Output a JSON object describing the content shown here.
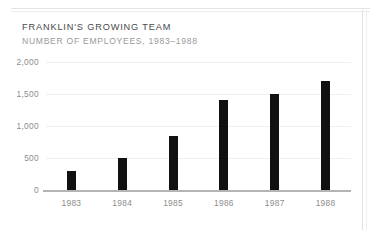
{
  "header": {
    "title": "FRANKLIN'S GROWING TEAM",
    "subtitle": "NUMBER OF EMPLOYEES, 1983–1988"
  },
  "colors": {
    "bar": "#111111",
    "gridline": "#f0f0f0",
    "axis": "#b4b4b4",
    "title_text": "#4a4a4a",
    "subtitle_text": "#9a9a9a",
    "tick_text": "#8d8d8d",
    "page_rule": "#e3e3e3"
  },
  "chart_data": {
    "type": "bar",
    "title": "FRANKLIN'S GROWING TEAM",
    "subtitle": "NUMBER OF EMPLOYEES, 1983–1988",
    "xlabel": "",
    "ylabel": "",
    "categories": [
      "1983",
      "1984",
      "1985",
      "1986",
      "1987",
      "1988"
    ],
    "values": [
      300,
      500,
      850,
      1400,
      1500,
      1700
    ],
    "ylim": [
      0,
      2000
    ],
    "yticks": [
      0,
      500,
      1000,
      1500,
      2000
    ],
    "ytick_labels": [
      "0",
      "500",
      "1,000",
      "1,500",
      "2,000"
    ],
    "grid": true,
    "legend": false
  }
}
